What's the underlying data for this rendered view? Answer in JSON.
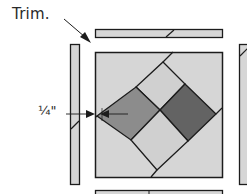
{
  "diagram": {
    "callouts": {
      "trim": "Trim.",
      "seam_allowance": "¼\""
    },
    "colors": {
      "light_fabric": "#d6d6d6",
      "medium_fabric": "#8c8c8c",
      "dark_fabric": "#636363",
      "outline": "#1c1c1c",
      "background": "#ffffff"
    },
    "parts": [
      {
        "name": "top-trim-strip"
      },
      {
        "name": "left-trim-strip"
      },
      {
        "name": "right-trim-strip"
      },
      {
        "name": "bottom-trim-strip"
      },
      {
        "name": "center-square-block"
      },
      {
        "name": "diamond-four-patch"
      }
    ]
  }
}
